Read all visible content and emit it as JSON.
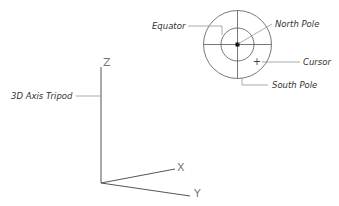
{
  "diagram": {
    "title": "",
    "compass": {
      "labels": {
        "equator": "Equator",
        "north_pole": "North Pole",
        "cursor": "Cursor",
        "south_pole": "South Pole"
      },
      "cursor_glyph": "+"
    },
    "tripod": {
      "label": "3D Axis Tripod",
      "axes": {
        "x": "X",
        "y": "Y",
        "z": "Z"
      }
    },
    "colors": {
      "line": "#555555",
      "leader": "#888888",
      "text": "#333333",
      "axis_label": "#777777"
    }
  }
}
